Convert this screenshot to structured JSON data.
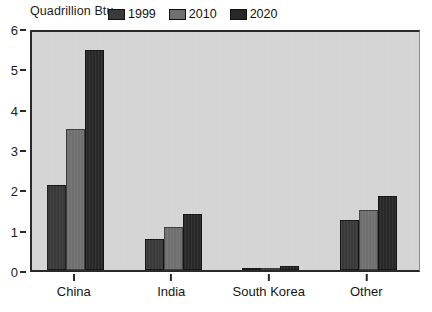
{
  "chart_data": {
    "type": "bar",
    "title": "Quadrillion Btu",
    "xlabel": "",
    "ylabel": "",
    "ylim": [
      0,
      6
    ],
    "ytick_labels": [
      "0",
      "1",
      "2",
      "3",
      "4",
      "5",
      "6"
    ],
    "ytick_values": [
      0,
      1,
      2,
      3,
      4,
      5,
      6
    ],
    "grid": false,
    "legend_position": "top-center-inside",
    "categories": [
      "China",
      "India",
      "South Korea",
      "Other"
    ],
    "series": [
      {
        "name": "1999",
        "color": "#3a3a3a",
        "values": [
          2.1,
          0.78,
          0.02,
          1.25
        ]
      },
      {
        "name": "2010",
        "color": "#707070",
        "values": [
          3.5,
          1.07,
          0.03,
          1.48
        ]
      },
      {
        "name": "2020",
        "color": "#282828",
        "values": [
          5.45,
          1.4,
          0.1,
          1.83
        ]
      }
    ]
  },
  "colors": {
    "plot_background": "#d4d4d4",
    "axis": "#2a2a2a",
    "page_background": "#ffffff",
    "series_1999": "#3a3a3a",
    "series_2010": "#707070",
    "series_2020": "#282828"
  }
}
